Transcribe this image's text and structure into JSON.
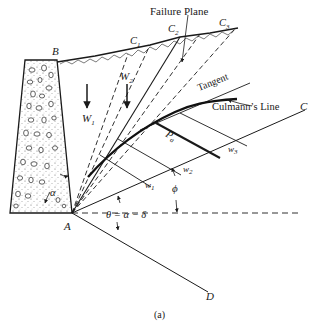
{
  "figure": {
    "caption": "(a)",
    "labels": {
      "failure_plane": "Failure Plane",
      "tangent": "Tangent",
      "culmann_line": "Culmann’s Line",
      "point_b": "B",
      "point_a": "A",
      "point_c": "C",
      "point_d": "D",
      "c1": "C",
      "c1_sub": "1",
      "c2": "C",
      "c2_sub": "2",
      "c3": "C",
      "c3_sub": "3",
      "w1_upper": "W",
      "w1_upper_sub": "1",
      "w2_upper": "W",
      "w2_upper_sub": "2",
      "w1_lower": "w",
      "w1_lower_sub": "1",
      "w2_lower": "w",
      "w2_lower_sub": "2",
      "w3_lower": "w",
      "w3_lower_sub": "3",
      "pa": "P",
      "pa_sub": "a",
      "phi": "ϕ",
      "alpha": "α",
      "theta_eq": "θ = α − δ"
    },
    "colors": {
      "line": "#1a1a1a",
      "background": "#ffffff",
      "wall_fill": "#f4f4f4"
    }
  }
}
